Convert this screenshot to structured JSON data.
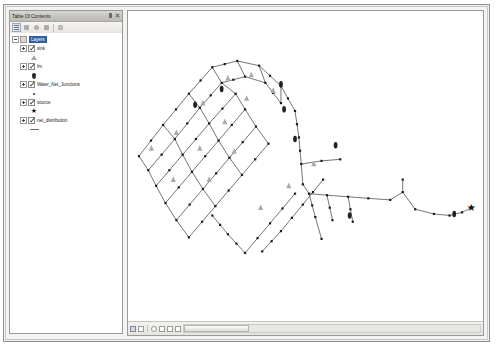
{
  "window": {
    "title": ""
  },
  "toc": {
    "title": "Table Of Contents",
    "pin_label": "Auto Hide",
    "close_label": "Close",
    "toolbar": [
      {
        "name": "list-by-drawing-order-button",
        "label": "List By Drawing Order",
        "active": true
      },
      {
        "name": "list-by-source-button",
        "label": "List By Source",
        "active": false
      },
      {
        "name": "list-by-visibility-button",
        "label": "List By Visibility",
        "active": false
      },
      {
        "name": "list-by-selection-button",
        "label": "List By Selection",
        "active": false
      },
      {
        "name": "toc-options-button",
        "label": "Options",
        "active": false
      }
    ],
    "tree": [
      {
        "label": "Layers",
        "type": "group",
        "selected": true,
        "expanded": true,
        "checked": false,
        "symbol": "none"
      },
      {
        "label": "sink",
        "type": "layer",
        "selected": false,
        "expanded": false,
        "checked": true,
        "symbol": "triangle"
      },
      {
        "label": "fm",
        "type": "layer",
        "selected": false,
        "expanded": false,
        "checked": true,
        "symbol": "diamond"
      },
      {
        "label": "Water_Net_Junctions",
        "type": "layer",
        "selected": false,
        "expanded": false,
        "checked": true,
        "symbol": "dot"
      },
      {
        "label": "source",
        "type": "layer",
        "selected": false,
        "expanded": false,
        "checked": true,
        "symbol": "star"
      },
      {
        "label": "net_distribution",
        "type": "layer",
        "selected": false,
        "expanded": false,
        "checked": true,
        "symbol": "line"
      }
    ]
  },
  "map": {
    "view_buttons": [
      {
        "name": "data-view-button",
        "label": "Data View",
        "active": true
      },
      {
        "name": "layout-view-button",
        "label": "Layout View",
        "active": false
      },
      {
        "name": "refresh-view-button",
        "label": "Refresh View",
        "active": false
      },
      {
        "name": "pause-drawing-button",
        "label": "Pause Drawing",
        "active": false
      },
      {
        "name": "zoom-whole-page-button",
        "label": "Zoom Whole Page",
        "active": false
      },
      {
        "name": "page-fixed-zoom-in-button",
        "label": "Fixed Zoom In",
        "active": false
      }
    ],
    "scrollbar_label": "Horizontal scroll",
    "colors": {
      "line": "#3a3a3a",
      "node": "#1a1a1a",
      "sink": "#a9a9a9",
      "valve": "#222222",
      "source": "#111111",
      "background": "#ffffff"
    },
    "network": {
      "description": "Water distribution network schematic",
      "lines": [
        [
          [
            14,
            130
          ],
          [
            45,
            90
          ]
        ],
        [
          [
            45,
            90
          ],
          [
            78,
            50
          ]
        ],
        [
          [
            78,
            50
          ],
          [
            108,
            16
          ]
        ],
        [
          [
            108,
            16
          ],
          [
            140,
            8
          ]
        ],
        [
          [
            140,
            8
          ],
          [
            168,
            14
          ]
        ],
        [
          [
            168,
            14
          ],
          [
            196,
            40
          ]
        ],
        [
          [
            196,
            40
          ],
          [
            214,
            72
          ]
        ],
        [
          [
            214,
            72
          ],
          [
            219,
            106
          ]
        ],
        [
          [
            219,
            106
          ],
          [
            222,
            140
          ]
        ],
        [
          [
            222,
            140
          ],
          [
            224,
            166
          ]
        ],
        [
          [
            224,
            166
          ],
          [
            232,
            178
          ]
        ],
        [
          [
            232,
            178
          ],
          [
            255,
            180
          ]
        ],
        [
          [
            255,
            180
          ],
          [
            282,
            182
          ]
        ],
        [
          [
            282,
            182
          ],
          [
            308,
            184
          ]
        ],
        [
          [
            308,
            184
          ],
          [
            336,
            186
          ]
        ],
        [
          [
            336,
            186
          ],
          [
            352,
            176
          ]
        ],
        [
          [
            352,
            176
          ],
          [
            352,
            160
          ]
        ],
        [
          [
            26,
            148
          ],
          [
            60,
            108
          ]
        ],
        [
          [
            60,
            108
          ],
          [
            92,
            68
          ]
        ],
        [
          [
            92,
            68
          ],
          [
            120,
            36
          ]
        ],
        [
          [
            120,
            36
          ],
          [
            150,
            28
          ]
        ],
        [
          [
            150,
            28
          ],
          [
            176,
            36
          ]
        ],
        [
          [
            176,
            36
          ],
          [
            196,
            62
          ]
        ],
        [
          [
            14,
            130
          ],
          [
            26,
            148
          ]
        ],
        [
          [
            45,
            90
          ],
          [
            60,
            108
          ]
        ],
        [
          [
            78,
            50
          ],
          [
            92,
            68
          ]
        ],
        [
          [
            108,
            16
          ],
          [
            120,
            36
          ]
        ],
        [
          [
            140,
            8
          ],
          [
            150,
            28
          ]
        ],
        [
          [
            168,
            14
          ],
          [
            176,
            36
          ]
        ],
        [
          [
            196,
            40
          ],
          [
            196,
            62
          ]
        ],
        [
          [
            36,
            168
          ],
          [
            70,
            128
          ]
        ],
        [
          [
            70,
            128
          ],
          [
            104,
            88
          ]
        ],
        [
          [
            104,
            88
          ],
          [
            138,
            50
          ]
        ],
        [
          [
            26,
            148
          ],
          [
            36,
            168
          ]
        ],
        [
          [
            60,
            108
          ],
          [
            70,
            128
          ]
        ],
        [
          [
            92,
            68
          ],
          [
            104,
            88
          ]
        ],
        [
          [
            120,
            36
          ],
          [
            138,
            50
          ]
        ],
        [
          [
            48,
            190
          ],
          [
            82,
            150
          ]
        ],
        [
          [
            82,
            150
          ],
          [
            116,
            110
          ]
        ],
        [
          [
            116,
            110
          ],
          [
            150,
            70
          ]
        ],
        [
          [
            36,
            168
          ],
          [
            48,
            190
          ]
        ],
        [
          [
            70,
            128
          ],
          [
            82,
            150
          ]
        ],
        [
          [
            104,
            88
          ],
          [
            116,
            110
          ]
        ],
        [
          [
            138,
            50
          ],
          [
            150,
            70
          ]
        ],
        [
          [
            62,
            212
          ],
          [
            96,
            172
          ]
        ],
        [
          [
            96,
            172
          ],
          [
            130,
            132
          ]
        ],
        [
          [
            130,
            132
          ],
          [
            164,
            92
          ]
        ],
        [
          [
            48,
            190
          ],
          [
            62,
            212
          ]
        ],
        [
          [
            82,
            150
          ],
          [
            96,
            172
          ]
        ],
        [
          [
            116,
            110
          ],
          [
            130,
            132
          ]
        ],
        [
          [
            150,
            70
          ],
          [
            164,
            92
          ]
        ],
        [
          [
            78,
            234
          ],
          [
            112,
            194
          ]
        ],
        [
          [
            112,
            194
          ],
          [
            146,
            154
          ]
        ],
        [
          [
            146,
            154
          ],
          [
            180,
            114
          ]
        ],
        [
          [
            62,
            212
          ],
          [
            78,
            234
          ]
        ],
        [
          [
            96,
            172
          ],
          [
            112,
            194
          ]
        ],
        [
          [
            130,
            132
          ],
          [
            146,
            154
          ]
        ],
        [
          [
            164,
            92
          ],
          [
            180,
            114
          ]
        ],
        [
          [
            150,
            254
          ],
          [
            182,
            216
          ]
        ],
        [
          [
            182,
            216
          ],
          [
            214,
            178
          ]
        ],
        [
          [
            150,
            254
          ],
          [
            128,
            230
          ]
        ],
        [
          [
            128,
            230
          ],
          [
            108,
            206
          ]
        ],
        [
          [
            196,
            226
          ],
          [
            224,
            192
          ]
        ],
        [
          [
            224,
            192
          ],
          [
            250,
            160
          ]
        ],
        [
          [
            196,
            226
          ],
          [
            172,
            252
          ]
        ],
        [
          [
            222,
            140
          ],
          [
            248,
            136
          ]
        ],
        [
          [
            248,
            136
          ],
          [
            272,
            134
          ]
        ],
        [
          [
            232,
            178
          ],
          [
            240,
            208
          ]
        ],
        [
          [
            240,
            208
          ],
          [
            248,
            236
          ]
        ],
        [
          [
            255,
            180
          ],
          [
            262,
            212
          ]
        ],
        [
          [
            282,
            182
          ],
          [
            288,
            214
          ]
        ],
        [
          [
            352,
            176
          ],
          [
            368,
            198
          ]
        ],
        [
          [
            368,
            198
          ],
          [
            392,
            204
          ]
        ],
        [
          [
            392,
            204
          ],
          [
            412,
            206
          ]
        ],
        [
          [
            412,
            206
          ],
          [
            428,
            202
          ]
        ],
        [
          [
            428,
            202
          ],
          [
            440,
            196
          ]
        ]
      ],
      "nodes_count": 118,
      "sink_markers": 14,
      "valve_markers": 6,
      "source_marker": 1
    }
  }
}
